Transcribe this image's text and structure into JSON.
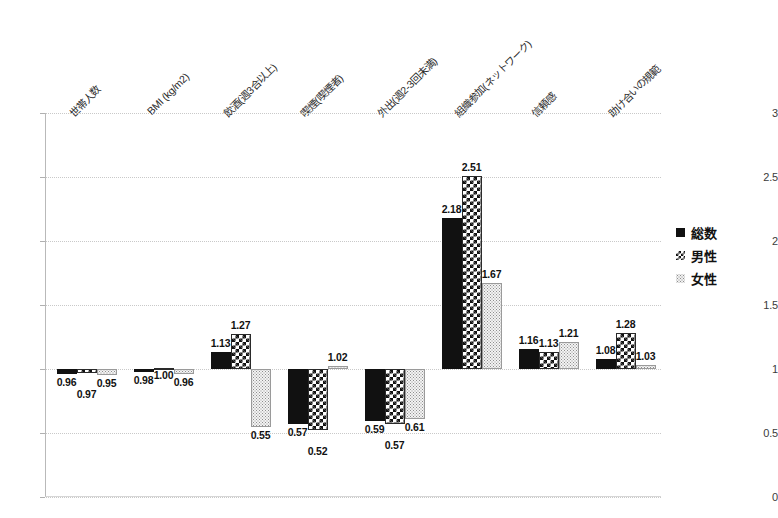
{
  "chart_data": {
    "type": "bar",
    "title": "",
    "xlabel": "",
    "ylabel": "",
    "ylim": [
      0,
      3
    ],
    "yticks": [
      "0",
      "0.5",
      "1",
      "1.5",
      "2",
      "2.5",
      "3"
    ],
    "grid": true,
    "legend_position": "right",
    "categories": [
      "世帯人数",
      "BMI (kg/m2)",
      "飲酒(週3合以上)",
      "喫煙(喫煙者)",
      "外出(週2-3回未満)",
      "組織参加(ネットワーク)",
      "信頼感",
      "助け合いの規範"
    ],
    "series": [
      {
        "name": "総数",
        "values": [
          0.96,
          0.98,
          1.13,
          0.57,
          0.59,
          2.18,
          1.16,
          1.08
        ]
      },
      {
        "name": "男性",
        "values": [
          0.97,
          1.0,
          1.27,
          0.52,
          0.57,
          2.51,
          1.13,
          1.28
        ]
      },
      {
        "name": "女性",
        "values": [
          0.95,
          0.96,
          0.55,
          1.02,
          0.61,
          1.67,
          1.21,
          1.03
        ]
      }
    ],
    "value_labels": [
      [
        "0.96",
        "0.97",
        "0.95"
      ],
      [
        "0.98",
        "1.00",
        "0.96"
      ],
      [
        "1.13",
        "1.27",
        "0.55"
      ],
      [
        "0.57",
        "0.52",
        "1.02"
      ],
      [
        "0.59",
        "0.57",
        "0.61"
      ],
      [
        "2.18",
        "2.51",
        "1.67"
      ],
      [
        "1.16",
        "1.13",
        "1.21"
      ],
      [
        "1.08",
        "1.28",
        "1.03"
      ]
    ],
    "colors": {
      "total": "#111111",
      "male": "#111111",
      "female": "#8e8e8e",
      "grid": "#c9c9c9",
      "axis": "#b0b0b0",
      "text": "#1a1a1a"
    }
  },
  "legend": {
    "items": [
      {
        "label": "総数",
        "pattern": "solid"
      },
      {
        "label": "男性",
        "pattern": "checker"
      },
      {
        "label": "女性",
        "pattern": "dotted"
      }
    ]
  }
}
